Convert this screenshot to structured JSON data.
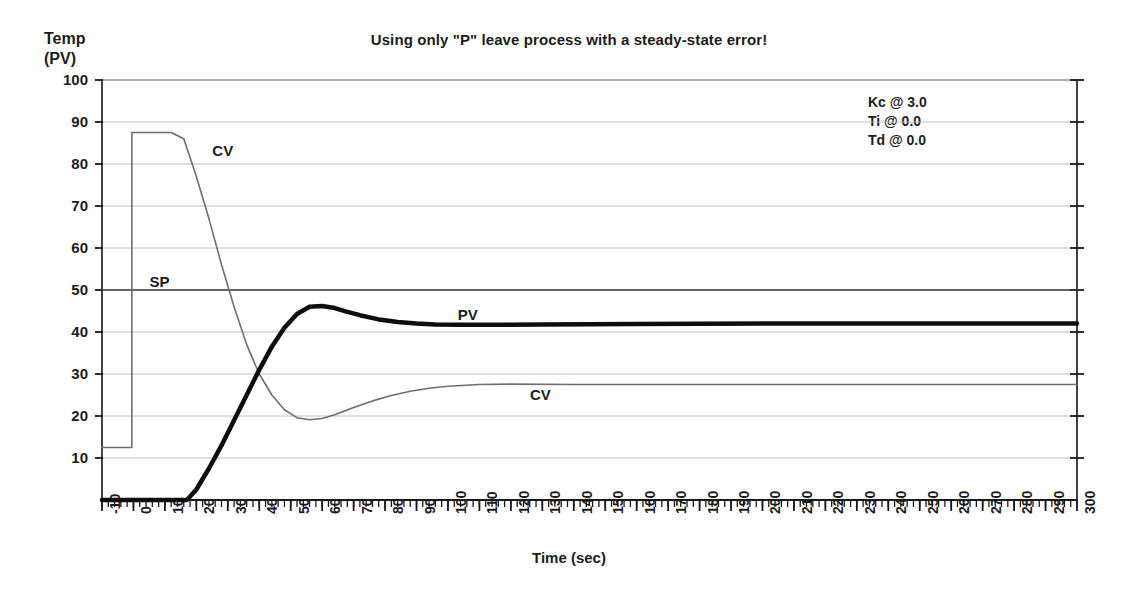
{
  "chart_data": {
    "type": "line",
    "title": "Using only \"P\" leave process with a steady-state error!",
    "xlabel": "Time (sec)",
    "ylabel": "Temp (PV)",
    "ylabel_line1": "Temp",
    "ylabel_line2": "(PV)",
    "xlim": [
      -10,
      300
    ],
    "ylim": [
      0,
      100
    ],
    "grid": true,
    "legend": "inline-annotations",
    "y_ticks": [
      10,
      20,
      30,
      40,
      50,
      60,
      70,
      80,
      90,
      100
    ],
    "x_ticks": [
      -10,
      0,
      10,
      20,
      30,
      40,
      50,
      60,
      70,
      80,
      90,
      100,
      110,
      120,
      130,
      140,
      150,
      160,
      170,
      180,
      190,
      200,
      210,
      220,
      230,
      240,
      250,
      260,
      270,
      280,
      290,
      300
    ],
    "x_minor_tick_step": 2,
    "annotations": [
      {
        "name": "kc",
        "text": "Kc @ 3.0",
        "x": 230,
        "y": 90
      },
      {
        "name": "ti",
        "text": "Ti @ 0.0",
        "x": 230,
        "y": 85
      },
      {
        "name": "td",
        "text": "Td @ 0.0",
        "x": 230,
        "y": 80
      }
    ],
    "inline_labels": [
      {
        "name": "cv-label-top",
        "text": "CV",
        "x": 27,
        "y": 83
      },
      {
        "name": "sp-label",
        "text": "SP",
        "x": 7,
        "y": 52
      },
      {
        "name": "pv-label",
        "text": "PV",
        "x": 105,
        "y": 44
      },
      {
        "name": "cv-label-bottom",
        "text": "CV",
        "x": 128,
        "y": 25
      }
    ],
    "series": [
      {
        "name": "SP",
        "label": "SP",
        "color": "#3a3a3a",
        "width": 1.6,
        "description": "Setpoint, constant at 50",
        "points": [
          [
            -10,
            50
          ],
          [
            300,
            50
          ]
        ]
      },
      {
        "name": "CV",
        "label": "CV",
        "color": "#6e6e6e",
        "width": 1.6,
        "description": "Controller output: starts 12.5, steps to 87.5 at t=0, ramps down crossing 50 near t=30, dips to minimum 19 near t=57, recovers to steady state 27.5",
        "points": [
          [
            -10,
            12.5
          ],
          [
            -0.5,
            12.5
          ],
          [
            -0.5,
            87.5
          ],
          [
            12,
            87.5
          ],
          [
            16,
            86
          ],
          [
            20,
            77
          ],
          [
            24,
            67
          ],
          [
            28,
            56
          ],
          [
            32,
            46
          ],
          [
            36,
            37
          ],
          [
            40,
            30
          ],
          [
            44,
            25
          ],
          [
            48,
            21.5
          ],
          [
            52,
            19.6
          ],
          [
            56,
            19.1
          ],
          [
            60,
            19.4
          ],
          [
            64,
            20.3
          ],
          [
            70,
            22.0
          ],
          [
            76,
            23.6
          ],
          [
            82,
            24.9
          ],
          [
            88,
            25.9
          ],
          [
            94,
            26.6
          ],
          [
            100,
            27.1
          ],
          [
            110,
            27.5
          ],
          [
            120,
            27.6
          ],
          [
            140,
            27.5
          ],
          [
            180,
            27.5
          ],
          [
            240,
            27.5
          ],
          [
            300,
            27.5
          ]
        ]
      },
      {
        "name": "PV",
        "label": "PV",
        "color": "#0d0d0d",
        "width": 4.5,
        "description": "Process variable: flat at 0 until t=17, rises steeply, overshoots to 46 at t=56, settles at steady-state 42 leaving offset below setpoint 50",
        "points": [
          [
            -10,
            0
          ],
          [
            17,
            0
          ],
          [
            20,
            2.5
          ],
          [
            24,
            7.5
          ],
          [
            28,
            13
          ],
          [
            32,
            19
          ],
          [
            36,
            25
          ],
          [
            40,
            31
          ],
          [
            44,
            36.5
          ],
          [
            48,
            41
          ],
          [
            52,
            44.3
          ],
          [
            56,
            46.0
          ],
          [
            60,
            46.2
          ],
          [
            64,
            45.7
          ],
          [
            68,
            44.8
          ],
          [
            72,
            44.0
          ],
          [
            78,
            43.0
          ],
          [
            84,
            42.4
          ],
          [
            90,
            42.0
          ],
          [
            96,
            41.8
          ],
          [
            104,
            41.7
          ],
          [
            114,
            41.7
          ],
          [
            130,
            41.8
          ],
          [
            160,
            41.9
          ],
          [
            200,
            42.0
          ],
          [
            250,
            42.0
          ],
          [
            300,
            42.0
          ]
        ]
      }
    ]
  }
}
